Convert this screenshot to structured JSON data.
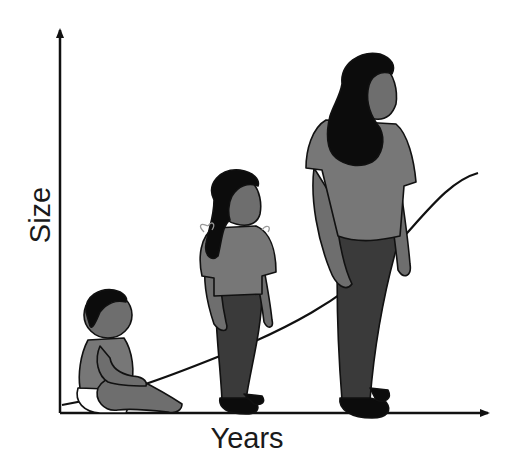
{
  "diagram": {
    "title": "",
    "y_axis_label": "Size",
    "x_axis_label": "Years",
    "curve": "growth curve (sigmoid) rising from lower-left to upper-right",
    "figures": [
      {
        "name": "baby",
        "pose": "sitting",
        "label": ""
      },
      {
        "name": "child",
        "pose": "standing",
        "label": ""
      },
      {
        "name": "teen",
        "pose": "standing",
        "label": ""
      }
    ]
  },
  "colors": {
    "outline": "#111111",
    "skin": "#6e6e6e",
    "shirt": "#7a7a7a",
    "pants": "#3a3a3a",
    "hair": "#0c0c0c",
    "diaper": "#ffffff",
    "background": "#ffffff"
  }
}
